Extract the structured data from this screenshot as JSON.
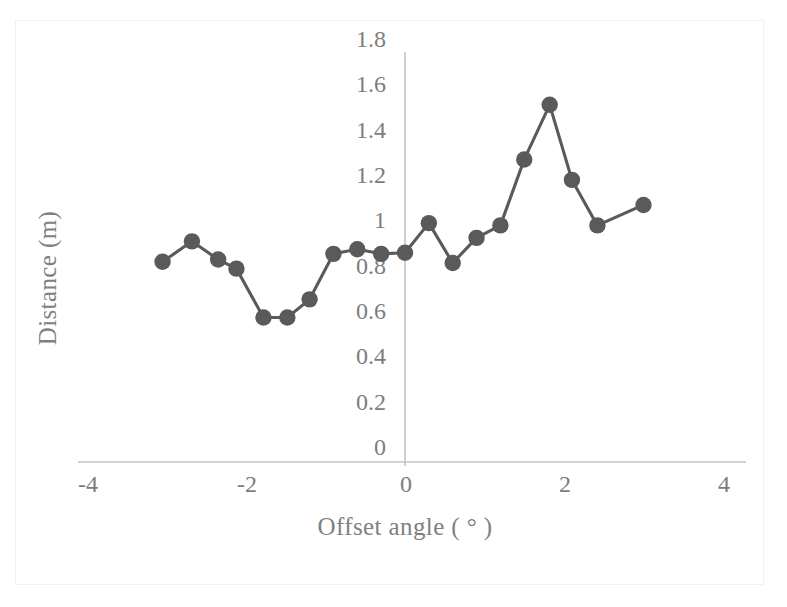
{
  "chart_data": {
    "type": "line",
    "title": "",
    "xlabel": "Offset angle ( ° )",
    "ylabel": "Distance (m)",
    "xlim": [
      -4,
      4
    ],
    "ylim": [
      0,
      1.8
    ],
    "xticks": [
      "-4",
      "-2",
      "0",
      "2",
      "4"
    ],
    "xtick_values": [
      -4,
      -2,
      0,
      2,
      4
    ],
    "yticks": [
      "0",
      "0.2",
      "0.4",
      "0.6",
      "0.8",
      "1",
      "1.2",
      "1.4",
      "1.6",
      "1.8"
    ],
    "ytick_values": [
      0,
      0.2,
      0.4,
      0.6,
      0.8,
      1,
      1.2,
      1.4,
      1.6,
      1.8
    ],
    "grid": false,
    "legend": null,
    "marker": "circle",
    "series_color": "#5a5a5a",
    "axis_color": "#bfbfbf",
    "x": [
      -3.05,
      -2.68,
      -2.35,
      -2.12,
      -1.78,
      -1.48,
      -1.2,
      -0.9,
      -0.6,
      -0.3,
      0.0,
      0.3,
      0.6,
      0.9,
      1.2,
      1.5,
      1.82,
      2.1,
      2.42,
      3.0
    ],
    "values": [
      0.88,
      0.97,
      0.89,
      0.85,
      0.635,
      0.635,
      0.715,
      0.915,
      0.935,
      0.915,
      0.92,
      1.05,
      0.875,
      0.985,
      1.04,
      1.33,
      1.57,
      1.24,
      1.04,
      1.13
    ],
    "series": [
      {
        "name": "Distance",
        "x": [
          -3.05,
          -2.68,
          -2.35,
          -2.12,
          -1.78,
          -1.48,
          -1.2,
          -0.9,
          -0.6,
          -0.3,
          0.0,
          0.3,
          0.6,
          0.9,
          1.2,
          1.5,
          1.82,
          2.1,
          2.42,
          3.0
        ],
        "values": [
          0.88,
          0.97,
          0.89,
          0.85,
          0.635,
          0.635,
          0.715,
          0.915,
          0.935,
          0.915,
          0.92,
          1.05,
          0.875,
          0.985,
          1.04,
          1.33,
          1.57,
          1.24,
          1.04,
          1.13
        ]
      }
    ]
  }
}
